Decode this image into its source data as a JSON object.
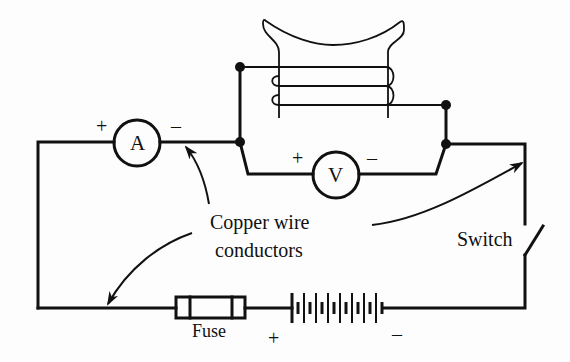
{
  "diagram": {
    "colors": {
      "ink": "#111111",
      "background": "#fdfdfd"
    },
    "components": {
      "ammeter": {
        "symbol": "A",
        "plus": "+",
        "minus": "–"
      },
      "voltmeter": {
        "symbol": "V",
        "plus": "+",
        "minus": "–"
      },
      "fuse": {
        "label": "Fuse"
      },
      "battery": {
        "plus": "+",
        "minus": "–",
        "cells": 8
      },
      "switch": {
        "label": "Switch",
        "state": "open"
      },
      "coil": {
        "turns": 3
      }
    },
    "annotations": {
      "conductors_line1": "Copper wire",
      "conductors_line2": "conductors"
    }
  }
}
